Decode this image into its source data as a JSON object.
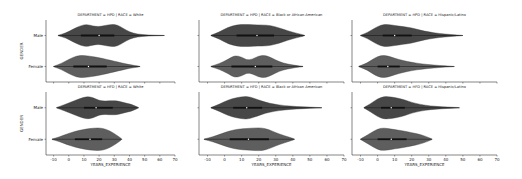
{
  "chart_data": {
    "type": "violin",
    "layout": "facet grid 2 rows x 3 columns, horizontal violins",
    "xlabel": "YEARS_EXPERIENCE",
    "ylabel": "GENDER",
    "x_ticks": [
      -10,
      0,
      10,
      20,
      30,
      40,
      50,
      60,
      70
    ],
    "xlim": [
      -15,
      70
    ],
    "categories": [
      "Male",
      "Female"
    ],
    "colors": {
      "Male": "#474747",
      "Female": "#5e5e5e",
      "inner": "#111111"
    },
    "panels": [
      {
        "title": "DEPARTMENT = HPD | RACE = White",
        "row": 0,
        "col": 0,
        "show_xticks": false,
        "show_ylabels": true,
        "violins": {
          "Male": {
            "min": -7,
            "max": 63,
            "q1": 8,
            "median": 20,
            "q3": 30,
            "profile": [
              [
                -7,
                0.02
              ],
              [
                -2,
                0.2
              ],
              [
                3,
                0.55
              ],
              [
                8,
                0.85
              ],
              [
                12,
                0.95
              ],
              [
                16,
                0.8
              ],
              [
                20,
                0.75
              ],
              [
                24,
                0.85
              ],
              [
                28,
                0.95
              ],
              [
                32,
                0.9
              ],
              [
                36,
                0.6
              ],
              [
                40,
                0.3
              ],
              [
                45,
                0.12
              ],
              [
                52,
                0.04
              ],
              [
                63,
                0.01
              ]
            ]
          },
          "Female": {
            "min": -10,
            "max": 47,
            "q1": 3,
            "median": 13,
            "q3": 25,
            "profile": [
              [
                -10,
                0.02
              ],
              [
                -5,
                0.25
              ],
              [
                0,
                0.6
              ],
              [
                5,
                0.9
              ],
              [
                10,
                0.95
              ],
              [
                15,
                0.85
              ],
              [
                20,
                0.75
              ],
              [
                25,
                0.6
              ],
              [
                30,
                0.45
              ],
              [
                35,
                0.3
              ],
              [
                40,
                0.15
              ],
              [
                47,
                0.02
              ]
            ]
          }
        }
      },
      {
        "title": "DEPARTMENT = HPD | RACE = Black or African American",
        "row": 0,
        "col": 1,
        "show_xticks": false,
        "show_ylabels": false,
        "violins": {
          "Male": {
            "min": -8,
            "max": 47,
            "q1": 7,
            "median": 19,
            "q3": 29,
            "profile": [
              [
                -8,
                0.02
              ],
              [
                -3,
                0.3
              ],
              [
                2,
                0.7
              ],
              [
                7,
                0.9
              ],
              [
                12,
                0.95
              ],
              [
                17,
                0.9
              ],
              [
                22,
                0.9
              ],
              [
                27,
                0.85
              ],
              [
                32,
                0.65
              ],
              [
                37,
                0.4
              ],
              [
                42,
                0.2
              ],
              [
                47,
                0.03
              ]
            ]
          },
          "Female": {
            "min": -8,
            "max": 46,
            "q1": 4,
            "median": 18,
            "q3": 28,
            "profile": [
              [
                -8,
                0.02
              ],
              [
                -3,
                0.25
              ],
              [
                2,
                0.6
              ],
              [
                6,
                0.95
              ],
              [
                10,
                0.8
              ],
              [
                13,
                0.55
              ],
              [
                16,
                0.6
              ],
              [
                20,
                0.9
              ],
              [
                24,
                0.95
              ],
              [
                28,
                0.7
              ],
              [
                32,
                0.4
              ],
              [
                37,
                0.2
              ],
              [
                42,
                0.08
              ],
              [
                46,
                0.02
              ]
            ]
          }
        }
      },
      {
        "title": "DEPARTMENT = HPD | RACE = Hispanic/Latino",
        "row": 0,
        "col": 2,
        "show_xticks": false,
        "show_ylabels": false,
        "violins": {
          "Male": {
            "min": -10,
            "max": 50,
            "q1": 3,
            "median": 10,
            "q3": 20,
            "profile": [
              [
                -10,
                0.02
              ],
              [
                -6,
                0.25
              ],
              [
                -2,
                0.6
              ],
              [
                2,
                0.9
              ],
              [
                6,
                0.95
              ],
              [
                10,
                0.85
              ],
              [
                15,
                0.75
              ],
              [
                20,
                0.65
              ],
              [
                25,
                0.45
              ],
              [
                30,
                0.3
              ],
              [
                36,
                0.17
              ],
              [
                43,
                0.08
              ],
              [
                50,
                0.01
              ]
            ]
          },
          "Female": {
            "min": -11,
            "max": 45,
            "q1": 0,
            "median": 6,
            "q3": 13,
            "profile": [
              [
                -11,
                0.02
              ],
              [
                -6,
                0.3
              ],
              [
                -2,
                0.7
              ],
              [
                2,
                0.95
              ],
              [
                6,
                0.9
              ],
              [
                10,
                0.7
              ],
              [
                15,
                0.5
              ],
              [
                20,
                0.35
              ],
              [
                26,
                0.22
              ],
              [
                33,
                0.12
              ],
              [
                40,
                0.05
              ],
              [
                45,
                0.01
              ]
            ]
          }
        }
      },
      {
        "title": "DEPARTMENT = HFD | RACE = White",
        "row": 1,
        "col": 0,
        "show_xticks": true,
        "show_ylabels": true,
        "violins": {
          "Male": {
            "min": -8,
            "max": 46,
            "q1": 10,
            "median": 18,
            "q3": 29,
            "profile": [
              [
                -8,
                0.02
              ],
              [
                -3,
                0.25
              ],
              [
                2,
                0.5
              ],
              [
                7,
                0.75
              ],
              [
                12,
                0.95
              ],
              [
                16,
                0.85
              ],
              [
                20,
                0.6
              ],
              [
                24,
                0.55
              ],
              [
                29,
                0.6
              ],
              [
                33,
                0.55
              ],
              [
                37,
                0.4
              ],
              [
                41,
                0.3
              ],
              [
                46,
                0.02
              ]
            ]
          },
          "Female": {
            "min": -11,
            "max": 35,
            "q1": 4,
            "median": 14,
            "q3": 22,
            "profile": [
              [
                -11,
                0.02
              ],
              [
                -6,
                0.2
              ],
              [
                -1,
                0.45
              ],
              [
                4,
                0.65
              ],
              [
                9,
                0.8
              ],
              [
                14,
                0.9
              ],
              [
                19,
                0.95
              ],
              [
                23,
                0.9
              ],
              [
                27,
                0.7
              ],
              [
                31,
                0.4
              ],
              [
                35,
                0.03
              ]
            ]
          }
        }
      },
      {
        "title": "DEPARTMENT = HFD | RACE = Black or African American",
        "row": 1,
        "col": 1,
        "show_xticks": true,
        "show_ylabels": false,
        "violins": {
          "Male": {
            "min": -8,
            "max": 57,
            "q1": 5,
            "median": 13,
            "q3": 22,
            "profile": [
              [
                -8,
                0.02
              ],
              [
                -3,
                0.3
              ],
              [
                2,
                0.65
              ],
              [
                7,
                0.85
              ],
              [
                12,
                0.95
              ],
              [
                15,
                0.9
              ],
              [
                19,
                0.7
              ],
              [
                24,
                0.45
              ],
              [
                29,
                0.3
              ],
              [
                35,
                0.18
              ],
              [
                42,
                0.1
              ],
              [
                50,
                0.05
              ],
              [
                57,
                0.01
              ]
            ]
          },
          "Female": {
            "min": -12,
            "max": 41,
            "q1": 3,
            "median": 14,
            "q3": 26,
            "profile": [
              [
                -12,
                0.02
              ],
              [
                -7,
                0.2
              ],
              [
                -2,
                0.45
              ],
              [
                3,
                0.7
              ],
              [
                8,
                0.85
              ],
              [
                13,
                0.9
              ],
              [
                18,
                0.95
              ],
              [
                22,
                0.95
              ],
              [
                26,
                0.8
              ],
              [
                30,
                0.55
              ],
              [
                35,
                0.3
              ],
              [
                41,
                0.03
              ]
            ]
          }
        }
      },
      {
        "title": "DEPARTMENT = HFD | RACE = Hispanic/Latino",
        "row": 1,
        "col": 2,
        "show_xticks": true,
        "show_ylabels": false,
        "violins": {
          "Male": {
            "min": -8,
            "max": 48,
            "q1": 2,
            "median": 8,
            "q3": 16,
            "profile": [
              [
                -8,
                0.02
              ],
              [
                -4,
                0.35
              ],
              [
                0,
                0.75
              ],
              [
                4,
                0.95
              ],
              [
                8,
                0.9
              ],
              [
                12,
                0.8
              ],
              [
                16,
                0.65
              ],
              [
                20,
                0.45
              ],
              [
                25,
                0.28
              ],
              [
                31,
                0.15
              ],
              [
                38,
                0.08
              ],
              [
                44,
                0.04
              ],
              [
                48,
                0.01
              ]
            ]
          },
          "Female": {
            "min": -10,
            "max": 32,
            "q1": 0,
            "median": 8,
            "q3": 17,
            "profile": [
              [
                -10,
                0.02
              ],
              [
                -6,
                0.35
              ],
              [
                -2,
                0.7
              ],
              [
                2,
                0.95
              ],
              [
                6,
                0.9
              ],
              [
                10,
                0.8
              ],
              [
                15,
                0.7
              ],
              [
                20,
                0.55
              ],
              [
                25,
                0.4
              ],
              [
                29,
                0.2
              ],
              [
                32,
                0.02
              ]
            ]
          }
        }
      }
    ]
  },
  "labels": {
    "xlabel": "YEARS_EXPERIENCE",
    "ylabel": "GENDER",
    "category_male": "Male",
    "category_female": "Female"
  }
}
